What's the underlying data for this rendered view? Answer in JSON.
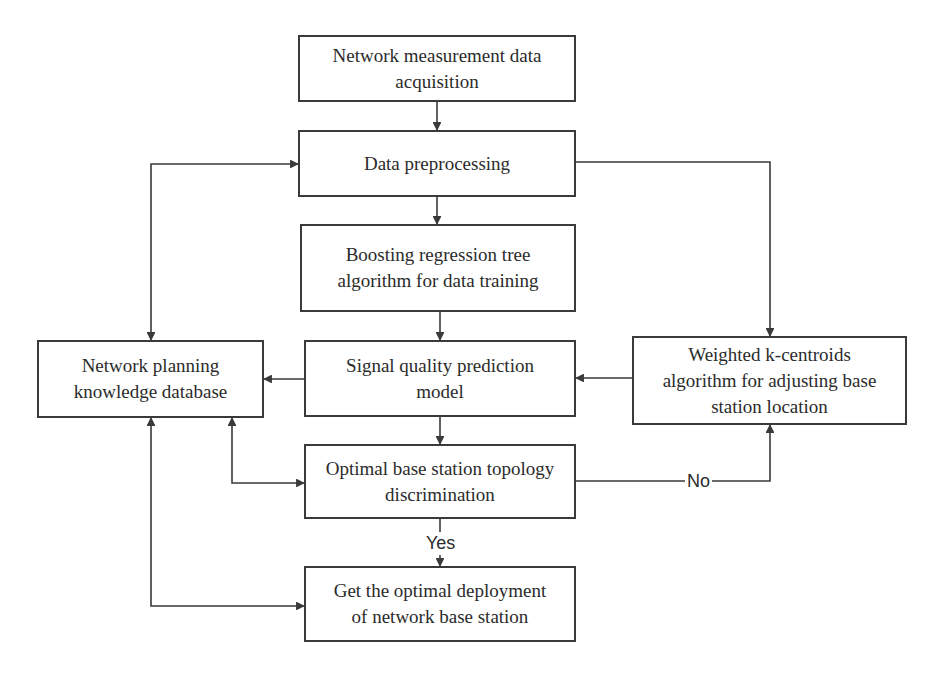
{
  "diagram": {
    "type": "flowchart",
    "colors": {
      "background": "#ffffff",
      "line": "#3a3a3a",
      "text": "#2b2b2b"
    },
    "nodes": {
      "acquisition": {
        "label": "Network measurement data acquisition",
        "line1": "Network measurement data",
        "line2": "acquisition"
      },
      "preprocessing": {
        "label": "Data preprocessing",
        "line1": "Data preprocessing"
      },
      "boosting": {
        "label": "Boosting regression tree algorithm for data training",
        "line1": "Boosting regression tree",
        "line2": "algorithm for data training"
      },
      "prediction": {
        "label": "Signal quality prediction model",
        "line1": "Signal quality prediction",
        "line2": "model"
      },
      "knowledge_db": {
        "label": "Network planning knowledge database",
        "line1": "Network planning",
        "line2": "knowledge database"
      },
      "kcentroids": {
        "label": "Weighted k-centroids algorithm for adjusting base station location",
        "line1": "Weighted k-centroids",
        "line2": "algorithm for adjusting base",
        "line3": "station location"
      },
      "discrimination": {
        "label": "Optimal base station topology discrimination",
        "line1": "Optimal base station topology",
        "line2": "discrimination"
      },
      "deployment": {
        "label": "Get the optimal deployment of network base station",
        "line1": "Get the optimal deployment",
        "line2": "of network base station"
      }
    },
    "edge_labels": {
      "yes": "Yes",
      "no": "No"
    },
    "edges": [
      {
        "from": "acquisition",
        "to": "preprocessing"
      },
      {
        "from": "preprocessing",
        "to": "boosting"
      },
      {
        "from": "boosting",
        "to": "prediction"
      },
      {
        "from": "prediction",
        "to": "discrimination"
      },
      {
        "from": "discrimination",
        "to": "deployment",
        "label": "Yes"
      },
      {
        "from": "discrimination",
        "to": "kcentroids",
        "label": "No"
      },
      {
        "from": "kcentroids",
        "to": "prediction"
      },
      {
        "from": "preprocessing",
        "to": "kcentroids"
      },
      {
        "from": "prediction",
        "to": "knowledge_db"
      },
      {
        "from": "knowledge_db",
        "to": "preprocessing",
        "bidirectional": true
      },
      {
        "from": "knowledge_db",
        "to": "discrimination",
        "bidirectional": true
      },
      {
        "from": "knowledge_db",
        "to": "deployment",
        "bidirectional": true
      }
    ]
  }
}
